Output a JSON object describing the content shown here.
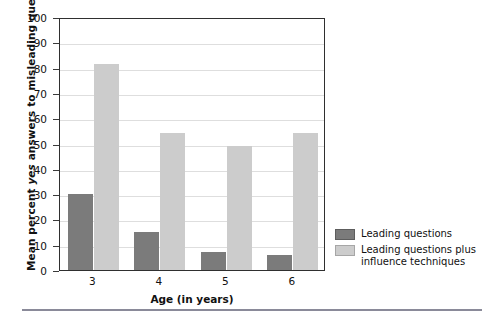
{
  "chart_data": {
    "type": "bar",
    "title": "",
    "xlabel": "Age (in years)",
    "ylabel": "Mean percent yes answers to misleading questions",
    "ylabel_parts": {
      "pre": "Mean percent ",
      "italic": "yes",
      "post": " answers to misleading questions"
    },
    "categories": [
      "3",
      "4",
      "5",
      "6"
    ],
    "series": [
      {
        "name": "Leading questions",
        "color": "#7b7b7b",
        "values": [
          30,
          15,
          7,
          6
        ]
      },
      {
        "name": "Leading questions plus influence techniques",
        "color": "#cccccc",
        "values": [
          81.5,
          54,
          49,
          54
        ]
      }
    ],
    "ylim": [
      0,
      100
    ],
    "ytick_labels": [
      "100",
      "90",
      "80",
      "70",
      "60",
      "50",
      "40",
      "30",
      "20",
      "10",
      "0"
    ],
    "ytick_values": [
      100,
      90,
      80,
      70,
      60,
      50,
      40,
      30,
      20,
      10,
      0
    ],
    "grid": true,
    "grid_color": "#dedede",
    "legend_position": "right",
    "legend": [
      {
        "label": "Leading questions",
        "label_line1": "Leading questions",
        "label_line2": "",
        "color": "#7b7b7b"
      },
      {
        "label": "Leading questions plus influence techniques",
        "label_line1": "Leading questions plus",
        "label_line2": "influence techniques",
        "color": "#cccccc"
      }
    ],
    "axis_color": "#2f2f2f",
    "background": "#ffffff"
  }
}
